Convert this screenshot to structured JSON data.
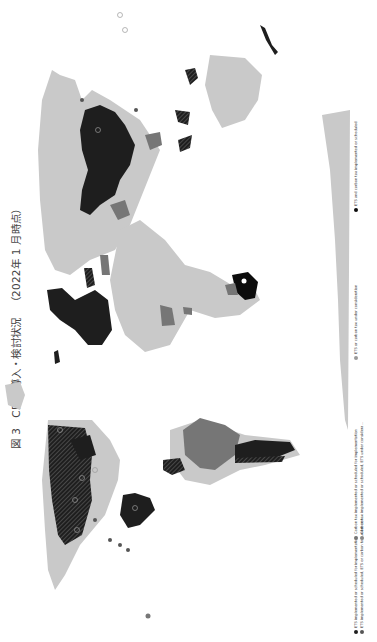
{
  "figure": {
    "label": "図 3",
    "title": "CP の導入・検討状況",
    "date_note": "（2022年 1 月時点）"
  },
  "colors": {
    "background": "#ffffff",
    "land_default": "#c9c9c9",
    "ets": "#1e1e1e",
    "carbon_tax": "#767676",
    "consideration": "#9a9a9a",
    "both": "#0c0c0c",
    "hatch": "#555555"
  },
  "legend": {
    "items": [
      {
        "label": "ETS implemented or scheduled for implementation",
        "swatch": "ets"
      },
      {
        "label": "ETS implemented or scheduled, ETS or carbon tax under con...",
        "swatch": "ets-hatched"
      },
      {
        "label": "Carbon tax implemented or scheduled for implementation",
        "swatch": "carbon_tax"
      },
      {
        "label": "Carbon tax implemented or scheduled, ETS under considera...",
        "swatch": "carbon_tax-hatched"
      },
      {
        "label": "ETS or carbon tax under consideration",
        "swatch": "consideration"
      },
      {
        "label": "ETS and carbon tax implemented or scheduled",
        "swatch": "both"
      }
    ]
  },
  "map": {
    "orientation": "rotated 90° counter-clockwise",
    "regions": [
      {
        "name": "North America (Canada)",
        "status": "ets-hatched"
      },
      {
        "name": "United States",
        "status": "land_default"
      },
      {
        "name": "Mexico",
        "status": "ets"
      },
      {
        "name": "South America (Brazil)",
        "status": "carbon_tax"
      },
      {
        "name": "Argentina",
        "status": "ets"
      },
      {
        "name": "Colombia",
        "status": "ets-hatched"
      },
      {
        "name": "Europe (EU)",
        "status": "ets"
      },
      {
        "name": "Russia",
        "status": "land_default"
      },
      {
        "name": "China",
        "status": "ets"
      },
      {
        "name": "Japan",
        "status": "ets-hatched"
      },
      {
        "name": "South Africa",
        "status": "both"
      },
      {
        "name": "Africa",
        "status": "land_default"
      },
      {
        "name": "Australia",
        "status": "land_default"
      },
      {
        "name": "New Zealand",
        "status": "ets"
      },
      {
        "name": "Antarctica",
        "status": "land_default"
      }
    ]
  }
}
